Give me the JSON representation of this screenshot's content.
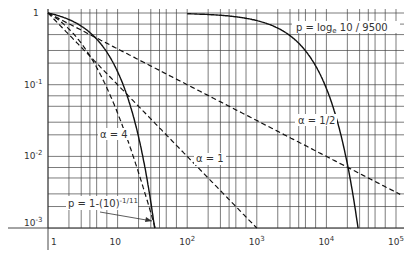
{
  "chart_data": {
    "type": "line",
    "title": "",
    "xlabel": "",
    "ylabel": "",
    "xscale": "log",
    "yscale": "log",
    "xlim": [
      1,
      100000
    ],
    "ylim": [
      0.001,
      1
    ],
    "grid": true,
    "x_ticks": [
      "1",
      "10",
      "10^2",
      "10^3",
      "10^4",
      "10^5"
    ],
    "y_ticks": [
      "1",
      "10^-1",
      "10^-2",
      "10^-3"
    ],
    "series": [
      {
        "name": "p = log_e 10 / 9500",
        "style": "solid",
        "formula": "exp(-p x)",
        "x": [
          100,
          1000,
          3000,
          10000,
          20000,
          28500
        ],
        "y": [
          0.976,
          0.785,
          0.484,
          0.089,
          0.0079,
          0.001
        ]
      },
      {
        "name": "α = 1/2",
        "style": "dashed",
        "formula": "x^(-1/2)",
        "x": [
          1,
          10,
          100,
          1000,
          10000,
          100000
        ],
        "y": [
          1,
          0.316,
          0.1,
          0.0316,
          0.01,
          0.00316
        ]
      },
      {
        "name": "α = 1",
        "style": "dashed",
        "formula": "x^(-1)",
        "x": [
          1,
          10,
          100,
          1000
        ],
        "y": [
          1,
          0.1,
          0.01,
          0.001
        ]
      },
      {
        "name": "α = 4",
        "style": "dashed",
        "formula": "((x+6.3)/7.3)^(-4)",
        "x": [
          1,
          3,
          10,
          20,
          34
        ],
        "y": [
          1,
          0.38,
          0.04,
          0.0058,
          0.001
        ]
      },
      {
        "name": "p = 1-(10)^-1/11",
        "style": "solid",
        "formula": "10^(-(x-1)/11)",
        "x": [
          1,
          5,
          12,
          23,
          34
        ],
        "y": [
          1,
          0.43,
          0.1,
          0.01,
          0.001
        ]
      }
    ],
    "annotations": [
      {
        "text": "p = log",
        "sub": "e",
        "rest": " 10 / 9500"
      },
      {
        "text": "α = 1/2"
      },
      {
        "text": "α = 4"
      },
      {
        "text": "α = 1"
      },
      {
        "text": "p = 1-(10)",
        "sup": "-1/11"
      }
    ]
  }
}
